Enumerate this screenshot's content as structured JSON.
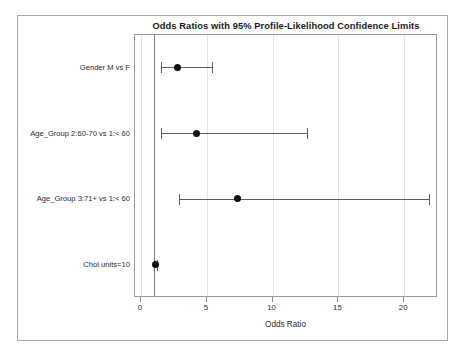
{
  "chart_data": {
    "type": "scatter",
    "subtype": "forest-plot",
    "title": "Odds Ratios with 95% Profile-Likelihood Confidence Limits",
    "xlabel": "Odds Ratio",
    "ylabel": "",
    "xlim": [
      0,
      22
    ],
    "xticks": [
      0,
      5,
      10,
      15,
      20
    ],
    "xticklabels": [
      "0",
      "5",
      "10",
      "15",
      "20"
    ],
    "grid": "vertical",
    "reference_line": 1,
    "legend": "none",
    "categories": [
      "Gender   M vs F",
      "Age_Group 2:60-70 vs 1:< 60",
      "Age_Group 3:71+  vs 1:< 60",
      "Chol units=10"
    ],
    "points": [
      {
        "label": "Gender   M vs F",
        "estimate": 2.8,
        "lower": 1.5,
        "upper": 5.4
      },
      {
        "label": "Age_Group 2:60-70 vs 1:< 60",
        "estimate": 4.2,
        "lower": 1.5,
        "upper": 12.6
      },
      {
        "label": "Age_Group 3:71+  vs 1:< 60",
        "estimate": 7.3,
        "lower": 2.9,
        "upper": 21.9
      },
      {
        "label": "Chol units=10",
        "estimate": 1.1,
        "lower": 1.0,
        "upper": 1.2
      }
    ],
    "colors": {
      "marker": "#111111",
      "ci_line": "#5d5d5d",
      "reference_line": "#7d7d7d",
      "gridline": "#e4e4e4",
      "axis": "#9a9a9a",
      "background": "#ffffff",
      "text": "#2b2b2b"
    }
  }
}
